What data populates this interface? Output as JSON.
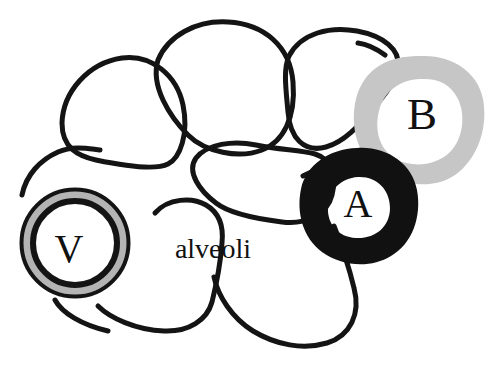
{
  "figure": {
    "kind": "hand-drawn anatomical line diagram",
    "width": 501,
    "height": 376,
    "background_color": "#ffffff"
  },
  "colors": {
    "ink": "#111111",
    "outline": "#141414",
    "gray_ring": "#c6c6c6",
    "vein_gray_ring": "#b4b4b4",
    "white": "#ffffff"
  },
  "labels": {
    "vein": "V",
    "artery": "A",
    "bronchiole": "B",
    "alveoli": "alveoli"
  },
  "label_positions": {
    "vein": {
      "x": 69,
      "y": 253,
      "font_size": 40
    },
    "artery": {
      "x": 358,
      "y": 213,
      "font_size": 40
    },
    "bronchiole": {
      "x": 424,
      "y": 124,
      "font_size": 44
    },
    "alveoli": {
      "x": 212,
      "y": 257,
      "font_size": 27
    }
  },
  "shapes": {
    "vein_ring": {
      "name": "vein-ring",
      "center": {
        "cx": 75,
        "cy": 243
      },
      "outer_radius": 56,
      "black_outer_width": 5,
      "gray_band_width": 6,
      "black_inner_width": 6
    },
    "artery_ring": {
      "name": "artery-ring",
      "center": {
        "cx": 359,
        "cy": 205
      },
      "outer_radius": 57,
      "inner_radius": 30,
      "fill": "#111111"
    },
    "bronchiole_ring": {
      "name": "bronchiole-ring",
      "center": {
        "cx": 421,
        "cy": 117
      },
      "outer_radius": 61,
      "inner_radius": 35,
      "fill": "#c6c6c6"
    }
  },
  "alveolus_sacs": [
    {
      "id": "sac-top-left",
      "name": "alveolus-top-left"
    },
    {
      "id": "sac-top-middle",
      "name": "alveolus-top-middle"
    },
    {
      "id": "sac-top-right",
      "name": "alveolus-top-right"
    },
    {
      "id": "sac-middle",
      "name": "alveolus-middle"
    },
    {
      "id": "sac-bottom-left",
      "name": "alveolus-bottom-left"
    },
    {
      "id": "sac-bottom-right",
      "name": "alveolus-bottom-right"
    }
  ]
}
